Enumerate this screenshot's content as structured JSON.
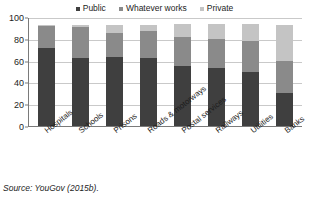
{
  "source_note": "Source: YouGov (2015b).",
  "legend": {
    "position": "top-center",
    "entries": [
      {
        "label": "Public",
        "color": "#3f3f3f",
        "marker": "square-marker-icon"
      },
      {
        "label": "Whatever works",
        "color": "#8a8a8a",
        "marker": "square-marker-icon"
      },
      {
        "label": "Private",
        "color": "#c4c4c4",
        "marker": "square-marker-icon"
      }
    ]
  },
  "chart_data": {
    "type": "bar",
    "subtype": "stacked-bar",
    "title": "",
    "subtitle": "",
    "xlabel": "",
    "ylabel": "",
    "ylim": [
      0,
      100
    ],
    "yticks": [
      0,
      20,
      40,
      60,
      80,
      100
    ],
    "grid": true,
    "legend_position": "top-center",
    "categories": [
      "Hospitals",
      "Schools",
      "Prisons",
      "Roads & motorways",
      "Postal services",
      "Railways",
      "Utilities",
      "Banks"
    ],
    "series": [
      {
        "name": "Public",
        "color": "#3f3f3f",
        "values": [
          72,
          62,
          63,
          62,
          55,
          53,
          50,
          30
        ]
      },
      {
        "name": "Whatever works",
        "color": "#8a8a8a",
        "values": [
          20,
          29,
          22,
          25,
          27,
          27,
          28,
          30
        ]
      },
      {
        "name": "Private",
        "color": "#c4c4c4",
        "values": [
          1,
          2,
          8,
          6,
          12,
          14,
          16,
          33
        ]
      }
    ]
  }
}
